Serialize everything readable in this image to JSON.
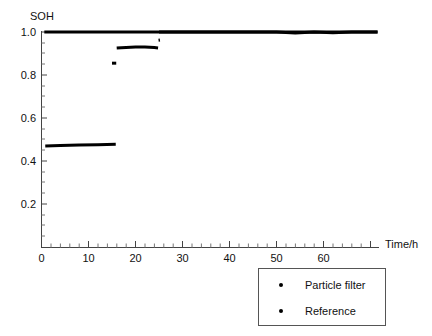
{
  "chart_data": {
    "type": "line",
    "title": "",
    "ylabel": "SOH",
    "xlabel": "Time/h",
    "xlim": [
      0,
      72
    ],
    "ylim": [
      0,
      1.06
    ],
    "grid": false,
    "legend_position": "bottom-right",
    "x_ticks": [
      0,
      10,
      20,
      30,
      40,
      50,
      60
    ],
    "x_tick_labels": [
      "0",
      "10",
      "20",
      "30",
      "40",
      "50",
      "60"
    ],
    "x_minor_step": 2,
    "y_ticks": [
      0.2,
      0.4,
      0.6,
      0.8,
      1.0
    ],
    "y_tick_labels": [
      "0.2",
      "0.4",
      "0.6",
      "0.8",
      "1.0"
    ],
    "y_minor_step": 0.05,
    "series": [
      {
        "name": "Reference",
        "marker": "dot",
        "color": "#000000",
        "linewidth": 3,
        "points": [
          [
            0.6,
            1.0
          ],
          [
            5,
            1.0
          ],
          [
            10,
            1.0
          ],
          [
            15,
            1.0
          ],
          [
            20,
            1.0
          ],
          [
            25,
            1.0
          ],
          [
            30,
            1.0
          ],
          [
            35,
            1.0
          ],
          [
            40,
            1.0
          ],
          [
            45,
            1.0
          ],
          [
            50,
            1.0
          ],
          [
            55,
            1.0
          ],
          [
            60,
            1.0
          ],
          [
            65,
            1.0
          ],
          [
            71.5,
            1.0
          ]
        ]
      },
      {
        "name": "Particle filter",
        "marker": "dot",
        "color": "#000000",
        "linewidth": 3,
        "segments": [
          {
            "comment": "initial low plateau",
            "points": [
              [
                0.8,
                0.47
              ],
              [
                4,
                0.472
              ],
              [
                8,
                0.474
              ],
              [
                12,
                0.476
              ],
              [
                15.8,
                0.478
              ]
            ]
          },
          {
            "comment": "short intermediate dot",
            "points": [
              [
                15.0,
                0.855
              ],
              [
                15.9,
                0.855
              ]
            ]
          },
          {
            "comment": "second plateau",
            "points": [
              [
                16.0,
                0.925
              ],
              [
                18,
                0.928
              ],
              [
                20,
                0.93
              ],
              [
                22,
                0.93
              ],
              [
                24,
                0.928
              ],
              [
                24.8,
                0.926
              ]
            ]
          },
          {
            "comment": "short rise dots",
            "points": [
              [
                24.9,
                0.962
              ],
              [
                25.2,
                0.963
              ]
            ]
          },
          {
            "comment": "converged to reference",
            "points": [
              [
                25.0,
                1.0
              ],
              [
                27,
                1.0
              ],
              [
                30,
                1.0
              ],
              [
                34,
                1.0
              ],
              [
                38,
                1.0
              ],
              [
                42,
                1.0
              ],
              [
                46,
                1.0
              ],
              [
                50,
                1.0
              ],
              [
                54,
                0.995
              ],
              [
                58,
                1.0
              ],
              [
                62,
                0.996
              ],
              [
                66,
                1.0
              ],
              [
                71.5,
                1.0
              ]
            ]
          }
        ]
      }
    ]
  },
  "legend": {
    "entries": [
      {
        "label": "Particle filter",
        "marker": "dot"
      },
      {
        "label": "Reference",
        "marker": "dot"
      }
    ]
  }
}
